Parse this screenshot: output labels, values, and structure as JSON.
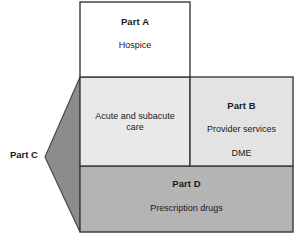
{
  "diagram": {
    "type": "block-diagram",
    "canvas": {
      "width": 298,
      "height": 240
    },
    "colors": {
      "part_a_fill": "#ffffff",
      "acute_cell_fill": "#e9e9e9",
      "part_b_fill": "#e3e3e3",
      "part_d_fill": "#b4b4b4",
      "part_c_arrow_fill": "#8c8c8c",
      "stroke": "#3a3a3a",
      "text": "#1a1a1a"
    },
    "blocks": {
      "part_a": {
        "title": "Part A",
        "desc": "Hospice"
      },
      "acute": {
        "desc": "Acute and subacute care"
      },
      "part_b": {
        "title": "Part B",
        "desc_line1": "Provider services",
        "desc_line2": "DME"
      },
      "part_c": {
        "title": "Part C"
      },
      "part_d": {
        "title": "Part D",
        "desc": "Prescription drugs"
      }
    }
  }
}
